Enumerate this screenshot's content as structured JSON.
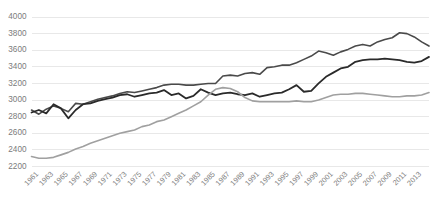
{
  "chart_data": {
    "type": "line",
    "title": "",
    "subtitle": "",
    "xlabel": "",
    "ylabel": "",
    "ylim": [
      2200,
      4000
    ],
    "ytick_step": 200,
    "yticks": [
      2200,
      2400,
      2600,
      2800,
      3000,
      3200,
      3400,
      3600,
      3800,
      4000
    ],
    "grid": true,
    "grid_axis": "y",
    "legend": false,
    "legend_position": "none",
    "x_start": 1960,
    "x_end": 2014,
    "x": [
      1960,
      1961,
      1962,
      1963,
      1964,
      1965,
      1966,
      1967,
      1968,
      1969,
      1970,
      1971,
      1972,
      1973,
      1974,
      1975,
      1976,
      1977,
      1978,
      1979,
      1980,
      1981,
      1982,
      1983,
      1984,
      1985,
      1986,
      1987,
      1988,
      1989,
      1990,
      1991,
      1992,
      1993,
      1994,
      1995,
      1996,
      1997,
      1998,
      1999,
      2000,
      2001,
      2002,
      2003,
      2004,
      2005,
      2006,
      2007,
      2008,
      2009,
      2010,
      2011,
      2012,
      2013,
      2014
    ],
    "xtick_labels": [
      "1961",
      "1963",
      "1965",
      "1967",
      "1969",
      "1971",
      "1973",
      "1975",
      "1977",
      "1979",
      "1981",
      "1983",
      "1985",
      "1987",
      "1989",
      "1991",
      "1993",
      "1995",
      "1997",
      "1999",
      "2001",
      "2003",
      "2005",
      "2007",
      "2009",
      "2011",
      "2013"
    ],
    "xtick_values": [
      1961,
      1963,
      1965,
      1967,
      1969,
      1971,
      1973,
      1975,
      1977,
      1979,
      1981,
      1983,
      1985,
      1987,
      1989,
      1991,
      1993,
      1995,
      1997,
      1999,
      2001,
      2003,
      2005,
      2007,
      2009,
      2011,
      2013
    ],
    "series": [
      {
        "name": "series-upper",
        "color": "#4a4a4a",
        "width": 1.6,
        "values": [
          2880,
          2830,
          2890,
          2930,
          2900,
          2860,
          2960,
          2950,
          2980,
          3010,
          3030,
          3050,
          3080,
          3100,
          3090,
          3110,
          3130,
          3150,
          3180,
          3190,
          3190,
          3180,
          3180,
          3190,
          3200,
          3200,
          3290,
          3300,
          3290,
          3320,
          3330,
          3310,
          3390,
          3400,
          3420,
          3420,
          3450,
          3490,
          3530,
          3590,
          3570,
          3540,
          3580,
          3610,
          3650,
          3670,
          3650,
          3700,
          3730,
          3750,
          3810,
          3800,
          3760,
          3700,
          3650
        ]
      },
      {
        "name": "series-middle",
        "color": "#2a2a2a",
        "width": 1.8,
        "values": [
          2850,
          2880,
          2840,
          2950,
          2900,
          2780,
          2880,
          2950,
          2960,
          2990,
          3010,
          3030,
          3060,
          3070,
          3040,
          3060,
          3080,
          3090,
          3120,
          3060,
          3080,
          3020,
          3050,
          3130,
          3090,
          3060,
          3080,
          3090,
          3070,
          3060,
          3080,
          3040,
          3060,
          3080,
          3090,
          3130,
          3180,
          3100,
          3110,
          3200,
          3280,
          3330,
          3380,
          3400,
          3460,
          3480,
          3490,
          3490,
          3500,
          3490,
          3480,
          3460,
          3450,
          3470,
          3520
        ]
      },
      {
        "name": "series-lower",
        "color": "#a0a0a0",
        "width": 1.6,
        "values": [
          2320,
          2300,
          2300,
          2310,
          2340,
          2370,
          2410,
          2440,
          2480,
          2510,
          2540,
          2570,
          2600,
          2620,
          2640,
          2680,
          2700,
          2740,
          2760,
          2800,
          2840,
          2880,
          2930,
          2980,
          3060,
          3130,
          3150,
          3140,
          3100,
          3030,
          2990,
          2980,
          2980,
          2980,
          2980,
          2980,
          2990,
          2980,
          2980,
          3000,
          3030,
          3060,
          3070,
          3070,
          3080,
          3080,
          3070,
          3060,
          3050,
          3040,
          3040,
          3050,
          3050,
          3060,
          3090
        ]
      }
    ]
  }
}
